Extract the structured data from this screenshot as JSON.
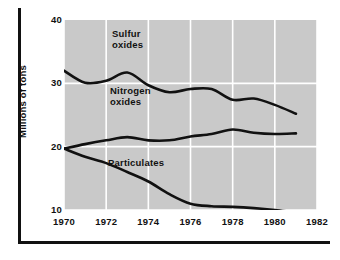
{
  "chart_data": {
    "type": "line",
    "title": "",
    "subtitle": "",
    "xlabel": "",
    "ylabel": "Millions of tons",
    "xlim": [
      1970,
      1982
    ],
    "ylim": [
      10,
      40
    ],
    "xticks": [
      1970,
      1972,
      1974,
      1976,
      1978,
      1980,
      1982
    ],
    "xtick_labels": [
      "1970",
      "1972",
      "1974",
      "1976",
      "1978",
      "1980",
      "1982"
    ],
    "yticks": [
      10,
      20,
      30,
      40
    ],
    "ytick_labels": [
      "10",
      "20",
      "30",
      "40"
    ],
    "grid": true,
    "grid_color": "#ffffff",
    "panel_color": "#c9c9c9",
    "line_color": "#111111",
    "legend_position": "inline-annotations",
    "x": [
      1970,
      1971,
      1972,
      1973,
      1974,
      1975,
      1976,
      1977,
      1978,
      1979,
      1980,
      1981
    ],
    "series": [
      {
        "name": "Sulfur oxides",
        "label": "Sulfur\noxides",
        "values": [
          32.0,
          30.1,
          30.4,
          31.7,
          29.7,
          28.6,
          29.1,
          29.1,
          27.4,
          27.6,
          26.6,
          25.2
        ]
      },
      {
        "name": "Nitrogen oxides",
        "label": "Nitrogen\noxides",
        "values": [
          19.7,
          20.4,
          21.0,
          21.5,
          21.0,
          21.0,
          21.6,
          22.0,
          22.7,
          22.2,
          22.0,
          22.1
        ]
      },
      {
        "name": "Particulates",
        "label": "Particulates",
        "values": [
          19.7,
          18.4,
          17.4,
          16.0,
          14.5,
          12.5,
          11.0,
          10.6,
          10.5,
          10.3,
          10.0,
          9.6
        ]
      }
    ]
  },
  "axis": {
    "y_title": "Millions of tons"
  },
  "annotations": {
    "sulfur": "Sulfur\noxides",
    "nitrogen": "Nitrogen\noxides",
    "particulates": "Particulates"
  }
}
